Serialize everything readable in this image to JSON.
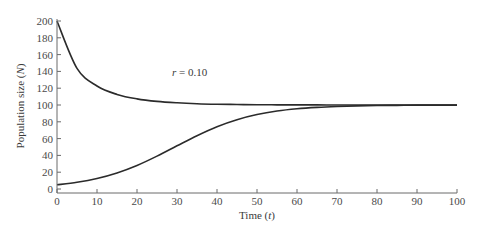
{
  "chart_data": {
    "type": "line",
    "title": "",
    "xlabel": "Time (t)",
    "xlabel_parts": {
      "prefix": "Time (",
      "var": "t",
      "suffix": ")"
    },
    "ylabel": "Population size (N)",
    "ylabel_parts": {
      "prefix": "Population size (",
      "var": "N",
      "suffix": ")"
    },
    "xlim": [
      0,
      100
    ],
    "ylim": [
      0,
      200
    ],
    "xticks": [
      0,
      10,
      20,
      30,
      40,
      50,
      60,
      70,
      80,
      90,
      100
    ],
    "yticks": [
      0,
      20,
      40,
      60,
      80,
      100,
      120,
      140,
      160,
      180,
      200
    ],
    "grid": false,
    "legend": null,
    "annotations": [
      {
        "text": "r = 0.10",
        "var": "r",
        "rest": " = 0.10",
        "x": 25,
        "y": 140
      }
    ],
    "x": [
      0,
      5,
      10,
      15,
      20,
      25,
      30,
      35,
      40,
      45,
      50,
      55,
      60,
      65,
      70,
      75,
      80,
      85,
      90,
      95,
      100
    ],
    "series": [
      {
        "name": "N0 = 200 (decline to K)",
        "values": [
          200,
          143.6,
          122.6,
          112.6,
          107.3,
          104.3,
          102.6,
          101.5,
          100.9,
          100.6,
          100.3,
          100.2,
          100.1,
          100.1,
          100.0,
          100.0,
          100.0,
          100.0,
          100.0,
          100.0,
          100.0
        ]
      },
      {
        "name": "N0 = 5 (logistic growth to K)",
        "values": [
          5.0,
          8.0,
          12.5,
          19.1,
          28.0,
          39.1,
          51.4,
          63.5,
          74.2,
          82.5,
          88.6,
          92.8,
          95.5,
          97.2,
          98.3,
          99.0,
          99.4,
          99.6,
          99.8,
          99.9,
          99.9
        ]
      }
    ],
    "carrying_capacity_K": 100,
    "growth_rate_r": 0.1,
    "line_color": "#2b2b2b",
    "axis_color": "#6a6a6a"
  }
}
